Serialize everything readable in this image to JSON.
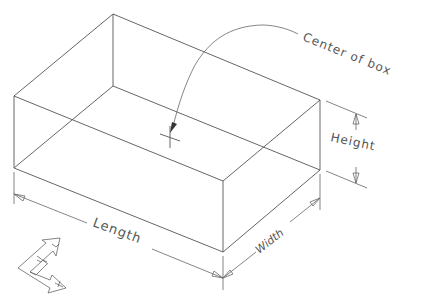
{
  "diagram": {
    "type": "isometric-box-dimensions",
    "labels": {
      "center": "Center of box",
      "length": "Length",
      "width": "Width",
      "height": "Height"
    },
    "ucs_icon": {
      "x_label": "X",
      "y_label": "Y"
    },
    "colors": {
      "line": "#555555",
      "background": "#ffffff"
    }
  }
}
